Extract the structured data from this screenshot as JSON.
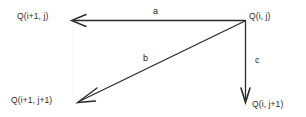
{
  "diagram": {
    "type": "vector-arrow-diagram",
    "background_color": "#ffffff",
    "stroke_color": "#2b2b2b",
    "text_color": "#2b2b2b",
    "width": 306,
    "height": 117,
    "origin_node": "Q(i, j)",
    "nodes": [
      {
        "id": "top-left",
        "label": "Q(i+1, j)",
        "x": 17,
        "y": 12
      },
      {
        "id": "top-right",
        "label": "Q(i, j)",
        "x": 249,
        "y": 12
      },
      {
        "id": "bottom-left",
        "label": "Q(i+1, j+1)",
        "x": 11,
        "y": 96
      },
      {
        "id": "bottom-right",
        "label": "Q(i, j+1)",
        "x": 252,
        "y": 100
      }
    ],
    "arrows": [
      {
        "id": "a",
        "label": "a",
        "from": "Q(i, j)",
        "to": "Q(i+1, j)",
        "direction": "left",
        "x1": 245,
        "y1": 20.5,
        "x2": 72,
        "y2": 20.5,
        "label_x": 153,
        "label_y": 7
      },
      {
        "id": "b",
        "label": "b",
        "from": "Q(i, j)",
        "to": "Q(i+1, j+1)",
        "direction": "down-left",
        "x1": 245,
        "y1": 21,
        "x2": 78,
        "y2": 102,
        "label_x": 143,
        "label_y": 54
      },
      {
        "id": "c",
        "label": "c",
        "from": "Q(i, j)",
        "to": "Q(i, j+1)",
        "direction": "down",
        "x1": 245.5,
        "y1": 20,
        "x2": 245.5,
        "y2": 101,
        "label_x": 255,
        "label_y": 56
      }
    ]
  }
}
